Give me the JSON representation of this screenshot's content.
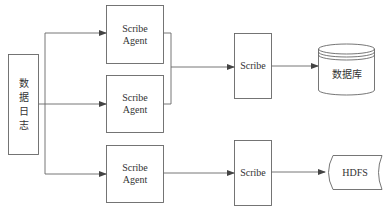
{
  "diagram": {
    "source": {
      "label": "数据日志",
      "chars": [
        "数",
        "据",
        "日",
        "志"
      ]
    },
    "agents": [
      {
        "label_line1": "Scribe",
        "label_line2": "Agent"
      },
      {
        "label_line1": "Scribe",
        "label_line2": "Agent"
      },
      {
        "label_line1": "Scribe",
        "label_line2": "Agent"
      }
    ],
    "scribes": [
      {
        "label": "Scribe"
      },
      {
        "label": "Scribe"
      }
    ],
    "stores": [
      {
        "label": "数据库",
        "shape": "cylinder"
      },
      {
        "label": "HDFS",
        "shape": "stored-data"
      }
    ],
    "colors": {
      "stroke": "#555555",
      "background": "#ffffff",
      "text": "#333333"
    }
  }
}
